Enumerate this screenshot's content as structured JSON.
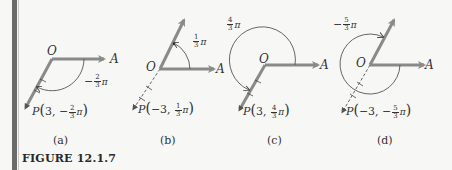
{
  "figure": {
    "title": "FIGURE 12.1.7",
    "colors": {
      "background": "#f7f7f6",
      "ray": "#8a8a8a",
      "arc": "#555555",
      "text": "#333333",
      "border": "#6b6b6b"
    }
  },
  "panels": [
    {
      "id": "a",
      "caption": "(a)",
      "origin_label": "O",
      "axis_label": "A",
      "angle": {
        "sign": "−",
        "num": "2",
        "den": "3",
        "pi": "π"
      },
      "point": {
        "name": "P",
        "r": "3",
        "sign": "−",
        "num": "2",
        "den": "3",
        "pi": "π"
      }
    },
    {
      "id": "b",
      "caption": "(b)",
      "origin_label": "O",
      "axis_label": "A",
      "angle": {
        "sign": "",
        "num": "1",
        "den": "3",
        "pi": "π"
      },
      "point": {
        "name": "P",
        "r": "−3",
        "sign": "",
        "num": "1",
        "den": "3",
        "pi": "π"
      }
    },
    {
      "id": "c",
      "caption": "(c)",
      "origin_label": "O",
      "axis_label": "A",
      "angle": {
        "sign": "",
        "num": "4",
        "den": "3",
        "pi": "π"
      },
      "point": {
        "name": "P",
        "r": "3",
        "sign": "",
        "num": "4",
        "den": "3",
        "pi": "π"
      }
    },
    {
      "id": "d",
      "caption": "(d)",
      "origin_label": "O",
      "axis_label": "A",
      "angle": {
        "sign": "−",
        "num": "5",
        "den": "3",
        "pi": "π"
      },
      "point": {
        "name": "P",
        "r": "−3",
        "sign": "−",
        "num": "5",
        "den": "3",
        "pi": "π"
      }
    }
  ]
}
